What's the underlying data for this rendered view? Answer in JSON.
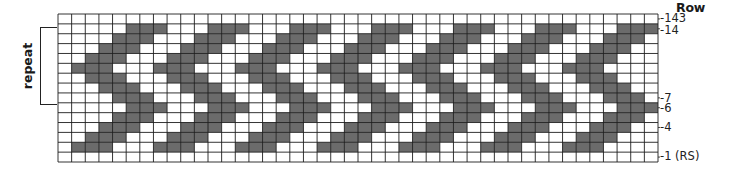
{
  "chart": {
    "type": "knitting-colorwork-chart",
    "columns": 44,
    "rows": 15,
    "colors": {
      "dark": "#6b6b6b",
      "light": "#ffffff",
      "grid": "#1e1e1e"
    },
    "header": "Row",
    "repeat_label": "repeat",
    "repeat_rows": {
      "from": 14,
      "to": 7
    },
    "row_labels": [
      {
        "row": 15,
        "text": "-143"
      },
      {
        "row": 14,
        "text": "-14"
      },
      {
        "row": 7,
        "text": "-7"
      },
      {
        "row": 6,
        "text": "-6"
      },
      {
        "row": 4,
        "text": "-4"
      },
      {
        "row": 1,
        "text": "-1 (RS)"
      }
    ],
    "dark_cells_by_row": {
      "15": [],
      "14": [
        5,
        6,
        7,
        11,
        12,
        13,
        17,
        18,
        19,
        23,
        24,
        25,
        29,
        30,
        31,
        35,
        36,
        37,
        41,
        42,
        43
      ],
      "13": [
        4,
        5,
        6,
        10,
        11,
        12,
        16,
        17,
        18,
        22,
        23,
        24,
        28,
        29,
        30,
        34,
        35,
        36,
        40,
        41,
        42
      ],
      "12": [
        3,
        4,
        5,
        9,
        10,
        11,
        15,
        16,
        17,
        21,
        22,
        23,
        27,
        28,
        29,
        33,
        34,
        35,
        39,
        40,
        41
      ],
      "11": [
        2,
        3,
        4,
        8,
        9,
        10,
        14,
        15,
        16,
        20,
        21,
        22,
        26,
        27,
        28,
        32,
        33,
        34,
        38,
        39,
        40
      ],
      "10": [
        1,
        2,
        3,
        7,
        8,
        9,
        13,
        14,
        15,
        19,
        20,
        21,
        25,
        26,
        27,
        31,
        32,
        33,
        37,
        38,
        39
      ],
      "9": [
        2,
        3,
        4,
        8,
        9,
        10,
        14,
        15,
        16,
        20,
        21,
        22,
        26,
        27,
        28,
        32,
        33,
        34,
        38,
        39,
        40
      ],
      "8": [
        3,
        4,
        5,
        9,
        10,
        11,
        15,
        16,
        17,
        21,
        22,
        23,
        27,
        28,
        29,
        33,
        34,
        35,
        39,
        40,
        41
      ],
      "7": [
        4,
        5,
        6,
        10,
        11,
        12,
        16,
        17,
        18,
        22,
        23,
        24,
        28,
        29,
        30,
        34,
        35,
        36,
        40,
        41,
        42
      ],
      "6": [
        5,
        6,
        7,
        11,
        12,
        13,
        17,
        18,
        19,
        23,
        24,
        25,
        29,
        30,
        31,
        35,
        36,
        37,
        41,
        42,
        43
      ],
      "5": [
        4,
        5,
        6,
        10,
        11,
        12,
        16,
        17,
        18,
        22,
        23,
        24,
        28,
        29,
        30,
        34,
        35,
        36,
        40,
        41,
        42
      ],
      "4": [
        3,
        4,
        5,
        9,
        10,
        11,
        15,
        16,
        17,
        21,
        22,
        23,
        27,
        28,
        29,
        33,
        34,
        35,
        39,
        40,
        41
      ],
      "3": [
        2,
        3,
        4,
        8,
        9,
        10,
        14,
        15,
        16,
        20,
        21,
        22,
        26,
        27,
        28,
        32,
        33,
        34,
        38,
        39,
        40
      ],
      "2": [
        1,
        2,
        3,
        7,
        8,
        9,
        13,
        14,
        15,
        19,
        20,
        21,
        25,
        26,
        27,
        31,
        32,
        33,
        37,
        38,
        39
      ],
      "1": []
    }
  }
}
